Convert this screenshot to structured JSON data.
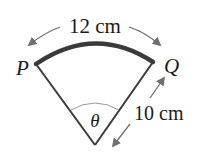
{
  "diagram": {
    "arc_length_label": "12 cm",
    "radius_label": "10 cm",
    "angle_label": "θ",
    "point_left_label": "P",
    "point_right_label": "Q",
    "colors": {
      "arc": "#3a3a3a",
      "radii": "#3a3a3a",
      "arrows": "#707070",
      "angle_arc": "#9a9a9a",
      "text": "#1a1a1a"
    }
  }
}
